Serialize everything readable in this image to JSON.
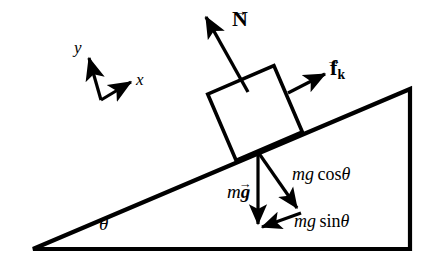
{
  "figure": {
    "background_color": "#ffffff",
    "ink_color": "#000000",
    "width": 431,
    "height": 261
  },
  "labels": {
    "normal_force": "N",
    "friction_force": "f",
    "friction_subscript": "k",
    "axis_y": "y",
    "axis_x": "x",
    "weight_m": "m",
    "weight_g": "g",
    "normal_component": "mg cos",
    "normal_component_m": "m",
    "normal_component_g": "g",
    "normal_component_cos": "cos",
    "parallel_component_sin": "sin",
    "theta": "θ",
    "incline_angle": "θ"
  },
  "geometry": {
    "incline_angle_degrees": 24,
    "base_left_vertex": [
      33,
      249
    ],
    "base_right_vertex": [
      410,
      249
    ],
    "apex_vertex": [
      410,
      89
    ],
    "block_center": [
      255,
      113
    ],
    "block_side_px": 72,
    "contact_point": [
      258,
      152
    ]
  },
  "vectors": [
    {
      "name": "normal-force-vector",
      "symbol": "N",
      "direction": "perpendicular to incline surface, pointing away from surface",
      "tail": [
        248,
        92
      ],
      "tip": [
        204,
        14
      ]
    },
    {
      "name": "friction-force-vector",
      "symbol": "f_k",
      "direction": "up the incline, parallel to surface",
      "tail": [
        290,
        92
      ],
      "tip": [
        325,
        74
      ]
    },
    {
      "name": "weight-vector",
      "symbol": "mg",
      "direction": "vertically downward",
      "tail": [
        258,
        152
      ],
      "tip": [
        258,
        228
      ]
    },
    {
      "name": "normal-component-vector",
      "symbol": "mg cos theta",
      "direction": "perpendicular into the incline surface",
      "tail": [
        258,
        152
      ],
      "tip": [
        300,
        212
      ]
    },
    {
      "name": "parallel-component-vector",
      "symbol": "mg sin theta",
      "direction": "down the incline, parallel to surface",
      "tail": [
        300,
        212
      ],
      "tip": [
        258,
        228
      ]
    },
    {
      "name": "axis-y-vector",
      "symbol": "y",
      "direction": "perpendicular to incline (local frame)",
      "tail": [
        101,
        100
      ],
      "tip": [
        87,
        53
      ]
    },
    {
      "name": "axis-x-vector",
      "symbol": "x",
      "direction": "up the incline (local frame)",
      "tail": [
        101,
        100
      ],
      "tip": [
        133,
        81
      ]
    }
  ]
}
